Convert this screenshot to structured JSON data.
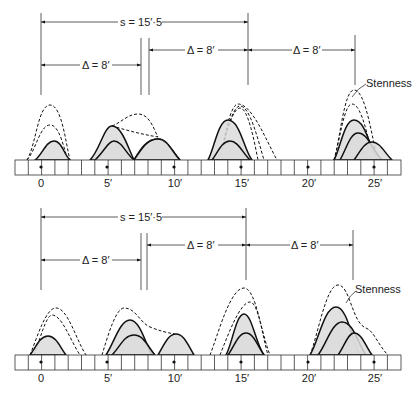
{
  "figure": {
    "panels": [
      {
        "id": "top",
        "dimensions": {
          "s_label": "s = 15′·5",
          "delta_left": "Δ = 8′",
          "delta_middle": "Δ = 8′",
          "delta_right": "Δ = 8′"
        },
        "annotation": "Stenness",
        "tick_labels": [
          "0",
          "5′",
          "10′",
          "15′",
          "20′",
          "25′"
        ]
      },
      {
        "id": "bottom",
        "dimensions": {
          "s_label": "s = 15′·5",
          "delta_left": "Δ = 8′",
          "delta_middle": "Δ = 8′",
          "delta_right": "Δ = 8′"
        },
        "annotation": "Stenness",
        "tick_labels": [
          "0",
          "5′",
          "10′",
          "15′",
          "20′",
          "25′"
        ]
      }
    ],
    "strip": {
      "cells": 29,
      "feet_per_cell": 1,
      "marked_positions_ft": [
        0,
        5,
        10,
        15,
        20,
        25
      ]
    },
    "colors": {
      "line": "#111111",
      "fill": "#dcdcdc",
      "background": "#ffffff"
    }
  }
}
